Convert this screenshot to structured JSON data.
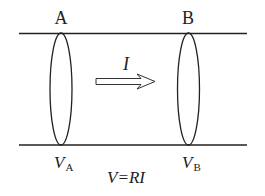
{
  "labels": {
    "point_a": "A",
    "point_b": "B",
    "current": "I",
    "potential_a_main": "V",
    "potential_a_sub": "A",
    "potential_b_main": "V",
    "potential_b_sub": "B",
    "law": "V=RI"
  },
  "colors": {
    "stroke": "#222222",
    "background": "#ffffff"
  }
}
